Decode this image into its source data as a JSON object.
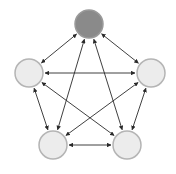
{
  "diagram": {
    "type": "complete-graph",
    "edge_style": "bidirectional-arrow",
    "colors": {
      "background": "#ffffff",
      "highlight_node_fill": "#8a8a8a",
      "highlight_node_stroke": "#9a9a9a",
      "node_fill": "#ececec",
      "node_stroke": "#b4b4b4",
      "edge": "#2a2a2a"
    },
    "nodes": [
      {
        "id": "top",
        "cx": 89,
        "cy": 24,
        "r": 14,
        "highlighted": true
      },
      {
        "id": "left",
        "cx": 29,
        "cy": 73,
        "r": 14,
        "highlighted": false
      },
      {
        "id": "right",
        "cx": 151,
        "cy": 73,
        "r": 14,
        "highlighted": false
      },
      {
        "id": "bottom-left",
        "cx": 53,
        "cy": 145,
        "r": 14,
        "highlighted": false
      },
      {
        "id": "bottom-right",
        "cx": 127,
        "cy": 145,
        "r": 14,
        "highlighted": false
      }
    ],
    "edges": [
      [
        "top",
        "left"
      ],
      [
        "top",
        "right"
      ],
      [
        "top",
        "bottom-left"
      ],
      [
        "top",
        "bottom-right"
      ],
      [
        "left",
        "right"
      ],
      [
        "left",
        "bottom-left"
      ],
      [
        "left",
        "bottom-right"
      ],
      [
        "right",
        "bottom-left"
      ],
      [
        "right",
        "bottom-right"
      ],
      [
        "bottom-left",
        "bottom-right"
      ]
    ]
  }
}
